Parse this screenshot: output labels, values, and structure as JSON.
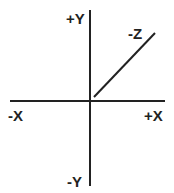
{
  "diagram": {
    "type": "3d-coordinate-axes",
    "colors": {
      "line": "#222222",
      "text": "#222222",
      "background": "#ffffff"
    },
    "axes": {
      "x": {
        "positive_label": "+X",
        "negative_label": "-X"
      },
      "y": {
        "positive_label": "+Y",
        "negative_label": "-Y"
      },
      "z": {
        "label": "-Z"
      }
    }
  }
}
